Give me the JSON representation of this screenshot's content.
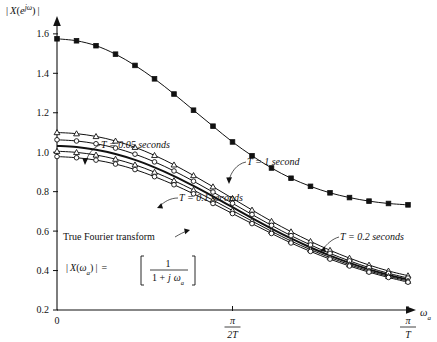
{
  "figure": {
    "title": "",
    "ylabel": "| X(e^{jω}) |",
    "ylabel_parts": {
      "bar_left": "|",
      "x": "X",
      "paren_open": "(",
      "e": "e",
      "sup": "jω",
      "paren_close": ")",
      "bar_right": "|"
    },
    "xlabel": "ωa",
    "xlabel_parts": {
      "omega": "ω",
      "sub": "a"
    }
  },
  "axes": {
    "y_ticks": [
      "0.2",
      "0.4",
      "0.6",
      "0.8",
      "1.0",
      "1.2",
      "1.4",
      "1.6"
    ],
    "y_tick_values": [
      0.2,
      0.4,
      0.6,
      0.8,
      1.0,
      1.2,
      1.4,
      1.6
    ],
    "ylim": [
      0.2,
      1.65
    ],
    "x_ticks": [
      "0",
      "π/2T",
      "π/T"
    ],
    "x_tick_values": [
      0.0,
      0.5,
      1.0
    ],
    "x_tick_origin": "0",
    "x_tick_mid_num": "π",
    "x_tick_mid_den": "2T",
    "x_tick_end_num": "π",
    "x_tick_end_den": "T",
    "xlim": [
      0.0,
      1.0
    ],
    "grid": false
  },
  "annotations": {
    "t1": "T = 1 second",
    "t005": "T = 0.05 seconds",
    "t01": "T = 0.1 seconds",
    "t02": "T = 0.2 seconds",
    "true_ft": "True Fourier transform",
    "formula": {
      "lhs_bar_l": "|",
      "lhs_x": "X",
      "lhs_open": "(",
      "lhs_omega": "ω",
      "lhs_sub": "a",
      "lhs_close": ")",
      "lhs_bar_r": "|",
      "eq": "=",
      "num": "1",
      "den_one": "1 +",
      "den_j": "j",
      "den_omega": "ω",
      "den_sub": "a"
    }
  },
  "colors": {
    "ink": "#111111",
    "paper": "#ffffff"
  },
  "chart_data": {
    "type": "line",
    "title": "",
    "xlabel": "ωa",
    "ylabel": "| X(e^{jω}) |",
    "xlim": [
      0.0,
      1.0
    ],
    "ylim": [
      0.2,
      1.65
    ],
    "x_tick_labels": [
      "0",
      "π/2T",
      "π/T"
    ],
    "x_tick_positions": [
      0.0,
      0.5,
      1.0
    ],
    "y_tick_labels": [
      "0.2",
      "0.4",
      "0.6",
      "0.8",
      "1.0",
      "1.2",
      "1.4",
      "1.6"
    ],
    "grid": false,
    "legend": "inline-annotations",
    "x": [
      0.0,
      0.0556,
      0.1111,
      0.1667,
      0.2222,
      0.2778,
      0.3333,
      0.3889,
      0.4444,
      0.5,
      0.5556,
      0.6111,
      0.6667,
      0.7222,
      0.7778,
      0.8333,
      0.8889,
      0.9444,
      1.0
    ],
    "series": [
      {
        "name": "T = 1 second",
        "marker": "filled-square",
        "line_width": 1.0,
        "values": [
          1.575,
          1.565,
          1.54,
          1.497,
          1.44,
          1.372,
          1.295,
          1.213,
          1.132,
          1.052,
          0.982,
          0.92,
          0.868,
          0.827,
          0.794,
          0.77,
          0.752,
          0.74,
          0.733
        ]
      },
      {
        "name": "T = 0.05 seconds",
        "marker": "open-triangle",
        "line_width": 1.0,
        "values": [
          1.1,
          1.094,
          1.08,
          1.057,
          1.025,
          0.984,
          0.936,
          0.882,
          0.825,
          0.766,
          0.707,
          0.65,
          0.597,
          0.548,
          0.503,
          0.463,
          0.428,
          0.398,
          0.374
        ]
      },
      {
        "name": "T = 0.1 seconds",
        "marker": "open-circle",
        "line_width": 1.0,
        "values": [
          1.063,
          1.057,
          1.043,
          1.021,
          0.99,
          0.951,
          0.905,
          0.853,
          0.798,
          0.741,
          0.684,
          0.629,
          0.577,
          0.53,
          0.487,
          0.449,
          0.415,
          0.386,
          0.362
        ]
      },
      {
        "name": "True Fourier transform",
        "marker": "none",
        "line_width": 2.0,
        "values": [
          1.032,
          1.026,
          1.012,
          0.991,
          0.961,
          0.923,
          0.879,
          0.829,
          0.776,
          0.721,
          0.666,
          0.613,
          0.563,
          0.517,
          0.476,
          0.439,
          0.406,
          0.378,
          0.354
        ]
      },
      {
        "name": "T = 0.2 seconds",
        "marker": "open-triangle",
        "line_width": 1.0,
        "values": [
          1.005,
          0.999,
          0.986,
          0.965,
          0.936,
          0.899,
          0.856,
          0.808,
          0.757,
          0.704,
          0.651,
          0.599,
          0.55,
          0.506,
          0.466,
          0.43,
          0.398,
          0.371,
          0.347
        ]
      },
      {
        "name": "lower-envelope",
        "marker": "open-circle",
        "line_width": 1.0,
        "values": [
          0.978,
          0.972,
          0.96,
          0.94,
          0.912,
          0.876,
          0.835,
          0.789,
          0.74,
          0.689,
          0.638,
          0.588,
          0.54,
          0.497,
          0.458,
          0.423,
          0.392,
          0.365,
          0.341
        ]
      }
    ]
  }
}
